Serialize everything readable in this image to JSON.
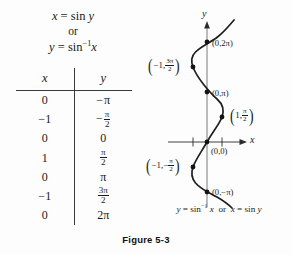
{
  "figure": {
    "label": "Figure 5-3"
  },
  "equations": {
    "line1_lhs": "x",
    "line1_eq": "=",
    "line1_fn": "sin",
    "line1_arg": "y",
    "or": "or",
    "line2_lhs": "y",
    "line2_eq": "=",
    "line2_fn": "sin",
    "line2_sup": "−1",
    "line2_arg": "x"
  },
  "table": {
    "headers": [
      "x",
      "y"
    ],
    "rows": [
      {
        "x": "0",
        "y_sign": "−",
        "y_whole": "π",
        "y_num": "",
        "y_den": ""
      },
      {
        "x": "−1",
        "y_sign": "−",
        "y_whole": "",
        "y_num": "π",
        "y_den": "2"
      },
      {
        "x": "0",
        "y_sign": "",
        "y_whole": "0",
        "y_num": "",
        "y_den": ""
      },
      {
        "x": "1",
        "y_sign": "",
        "y_whole": "",
        "y_num": "π",
        "y_den": "2"
      },
      {
        "x": "0",
        "y_sign": "",
        "y_whole": "π",
        "y_num": "",
        "y_den": ""
      },
      {
        "x": "−1",
        "y_sign": "",
        "y_whole": "",
        "y_num": "3π",
        "y_den": "2"
      },
      {
        "x": "0",
        "y_sign": "",
        "y_whole": "2π",
        "y_num": "",
        "y_den": ""
      }
    ]
  },
  "graph": {
    "x_axis_label": "x",
    "y_axis_label": "y",
    "caption": {
      "lhs": "y",
      "eq1": "=",
      "fn1": "sin",
      "sup1": "−1",
      "arg1": "x",
      "or": "or",
      "rhs": "x",
      "eq2": "=",
      "fn2": "sin",
      "arg2": "y"
    },
    "points": [
      {
        "name": "point-0-2pi",
        "text": "(0,2π)"
      },
      {
        "name": "point-neg1-3pi-2",
        "open": "(",
        "lead": "−1,",
        "num": "3π",
        "den": "2",
        "close": ")"
      },
      {
        "name": "point-0-pi",
        "text": "(0,π)"
      },
      {
        "name": "point-1-pi-2",
        "open": "(",
        "lead": "1,",
        "num": "π",
        "den": "2",
        "close": ")"
      },
      {
        "name": "point-0-0",
        "text": "(0,0)"
      },
      {
        "name": "point-neg1-neg-pi-2",
        "open": "(",
        "lead": "−1,−",
        "num": "π",
        "den": "2",
        "close": ")"
      },
      {
        "name": "point-0-neg-pi",
        "text": "(0,−π)"
      }
    ]
  },
  "chart_data": {
    "type": "line",
    "title": "Figure 5-3",
    "xlabel": "x",
    "ylabel": "y",
    "equation": "x = sin y  (y = sin^-1 x)",
    "xlim": [
      -1.6,
      1.6
    ],
    "ylim": [
      -3.6,
      7.2
    ],
    "grid": false,
    "legend": "none",
    "xticks": [
      -1,
      1
    ],
    "labeled_points": [
      {
        "x": 0,
        "y": 6.2832,
        "label": "(0,2π)"
      },
      {
        "x": -1,
        "y": 4.7124,
        "label": "(−1, 3π/2)"
      },
      {
        "x": 0,
        "y": 3.1416,
        "label": "(0,π)"
      },
      {
        "x": 1,
        "y": 1.5708,
        "label": "(1, π/2)"
      },
      {
        "x": 0,
        "y": 0,
        "label": "(0,0)"
      },
      {
        "x": -1,
        "y": -1.5708,
        "label": "(−1, −π/2)"
      },
      {
        "x": 0,
        "y": -3.1416,
        "label": "(0,−π)"
      }
    ],
    "table": {
      "columns": [
        "x",
        "y"
      ],
      "rows": [
        [
          0,
          "−π"
        ],
        [
          -1,
          "−π/2"
        ],
        [
          0,
          0
        ],
        [
          1,
          "π/2"
        ],
        [
          0,
          "π"
        ],
        [
          -1,
          "3π/2"
        ],
        [
          0,
          "2π"
        ]
      ]
    }
  }
}
